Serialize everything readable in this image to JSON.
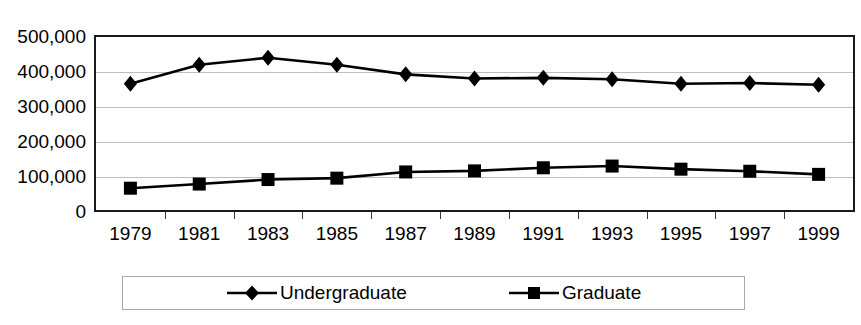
{
  "chart_data": {
    "type": "line",
    "title": "",
    "xlabel": "",
    "ylabel": "",
    "categories": [
      "1979",
      "1981",
      "1983",
      "1985",
      "1987",
      "1989",
      "1991",
      "1993",
      "1995",
      "1997",
      "1999"
    ],
    "series": [
      {
        "name": "Undergraduate",
        "marker": "diamond",
        "color": "#000000",
        "values": [
          365000,
          420000,
          440000,
          420000,
          392000,
          380000,
          382000,
          378000,
          365000,
          367000,
          362000
        ]
      },
      {
        "name": "Graduate",
        "marker": "square",
        "color": "#000000",
        "values": [
          63000,
          75000,
          88000,
          92000,
          110000,
          113000,
          122000,
          127000,
          118000,
          112000,
          103000
        ]
      }
    ],
    "ylim": [
      0,
      500000
    ],
    "y_ticks": [
      0,
      100000,
      200000,
      300000,
      400000,
      500000
    ],
    "y_tick_labels": [
      "0",
      "100,000",
      "200,000",
      "300,000",
      "400,000",
      "500,000"
    ],
    "grid": true,
    "grid_axis": "y",
    "legend_position": "bottom",
    "legend_entries": [
      "Undergraduate",
      "Graduate"
    ]
  }
}
